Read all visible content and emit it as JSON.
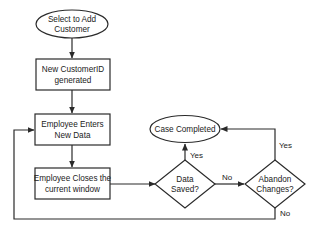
{
  "diagram": {
    "type": "flowchart",
    "colors": {
      "stroke": "#2a2a2a",
      "fill": "#ffffff",
      "text": "#222222"
    },
    "nodes": {
      "start": {
        "shape": "ellipse",
        "line1": "Select to Add",
        "line2": "Customer"
      },
      "new_id": {
        "shape": "rectangle",
        "line1": "New CustomerID",
        "line2": "generated"
      },
      "enter_data": {
        "shape": "rectangle",
        "line1": "Employee Enters",
        "line2": "New Data"
      },
      "close_window": {
        "shape": "rectangle",
        "line1": "Employee Closes the",
        "line2": "current window"
      },
      "data_saved": {
        "shape": "diamond",
        "line1": "Data",
        "line2": "Saved?"
      },
      "abandon": {
        "shape": "diamond",
        "line1": "Abandon",
        "line2": "Changes?"
      },
      "case_completed": {
        "shape": "ellipse",
        "line1": "Case Completed"
      }
    },
    "edges": {
      "saved_yes": "Yes",
      "saved_no": "No",
      "abandon_yes": "Yes",
      "abandon_no": "No"
    }
  }
}
